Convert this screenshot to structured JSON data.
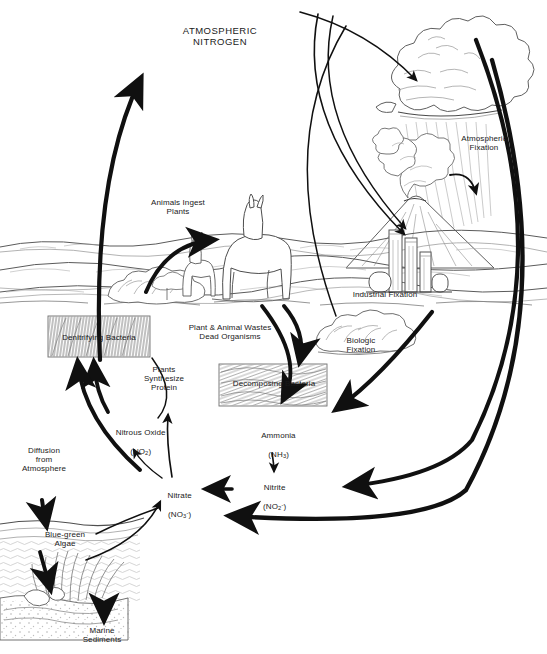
{
  "diagram": {
    "type": "nitrogen-cycle"
  },
  "labels": {
    "atmospheric_nitrogen": "ATMOSPHERIC\nNITROGEN",
    "atmospheric_fixation": "Atmospheric\nFixation",
    "industrial_fixation": "Industrial Fixation",
    "biologic_fixation": "Biologic\nFixation",
    "animals_ingest_plants": "Animals Ingest\nPlants",
    "denitrifying_bacteria": "Denitrifying Bacteria",
    "plant_animal_wastes": "Plant & Animal Wastes\nDead Organisms",
    "decomposing_bacteria": "Decomposing Bacteria",
    "plants_synthesize_protein": "Plants\nSynthesize\nProtein",
    "nitrous_oxide_name": "Nitrous Oxide",
    "nitrous_oxide_formula": "(NO2)",
    "ammonia_name": "Ammonia",
    "ammonia_formula": "(NH3)",
    "nitrite_name": "Nitrite",
    "nitrite_formula": "(NO2 -)",
    "nitrate_name": "Nitrate",
    "nitrate_formula": "(NO3 -)",
    "diffusion_from_atmosphere": "Diffusion\nfrom\nAtmosphere",
    "blue_green_algae": "Blue-green\nAlgae",
    "marine_sediments": "Marine\nSediments"
  },
  "formula_parts": {
    "nitrous_oxide": {
      "pre": "(NO",
      "sub": "2",
      "post": ")"
    },
    "ammonia": {
      "pre": "(NH",
      "sub": "3",
      "post": ")"
    },
    "nitrite": {
      "pre": "(NO",
      "sub": "2",
      "sup": "-",
      "post": ")"
    },
    "nitrate": {
      "pre": "(NO",
      "sub": "3",
      "sup": "-",
      "post": ")"
    }
  },
  "scene": {
    "cloud": "cumulus-cloud",
    "volcano": "erupting-volcano",
    "factory": "industrial-plant",
    "llama": "llama-adult",
    "llama_calf": "llama-calf",
    "shrub_left": "shrub",
    "shrub_right": "legume-shrub",
    "ocean": "ocean-water",
    "algae": "algae-mat",
    "sediment": "sea-floor-sediment",
    "hatched_box_denitrifying": "texture-box",
    "hatched_box_decomposing": "texture-box"
  },
  "colors": {
    "ink": "#1a1a1a",
    "arrow": "#101010",
    "line": "#555555",
    "paper": "#ffffff"
  },
  "flows": [
    {
      "from": "atmospheric-nitrogen",
      "to": "cloud",
      "kind": "thin"
    },
    {
      "from": "atmospheric-nitrogen",
      "to": "industrial-fixation",
      "kind": "thin"
    },
    {
      "from": "atmospheric-nitrogen",
      "to": "biologic-fixation",
      "kind": "thin"
    },
    {
      "from": "volcano",
      "to": "atmospheric-fixation",
      "kind": "thin-curve"
    },
    {
      "from": "atmosphere",
      "to": "nitrate",
      "kind": "thick"
    },
    {
      "from": "atmosphere",
      "to": "nitrite",
      "kind": "thick"
    },
    {
      "from": "biologic-fixation",
      "to": "ammonia",
      "kind": "thick"
    },
    {
      "from": "denitrifying-bacteria",
      "to": "atmospheric-nitrogen",
      "kind": "thick"
    },
    {
      "from": "plants",
      "to": "animals",
      "kind": "thick"
    },
    {
      "from": "plant-animal-wastes",
      "to": "decomposing-bacteria",
      "kind": "thick"
    },
    {
      "from": "decomposing-bacteria",
      "to": "ammonia",
      "kind": "thick"
    },
    {
      "from": "ammonia",
      "to": "nitrite",
      "kind": "thin"
    },
    {
      "from": "nitrite",
      "to": "nitrate",
      "kind": "thick"
    },
    {
      "from": "nitrate",
      "to": "plants-synthesize-protein",
      "kind": "thin"
    },
    {
      "from": "nitrate",
      "to": "nitrous-oxide",
      "kind": "thin"
    },
    {
      "from": "nitrous-oxide",
      "to": "denitrifying-bacteria",
      "kind": "thick"
    },
    {
      "from": "nitrate",
      "to": "denitrifying-bacteria",
      "kind": "thick"
    },
    {
      "from": "atmosphere",
      "to": "blue-green-algae",
      "kind": "thick"
    },
    {
      "from": "blue-green-algae",
      "to": "marine-sediments",
      "kind": "thick"
    },
    {
      "from": "blue-green-algae",
      "to": "nitrate",
      "kind": "thin"
    }
  ]
}
